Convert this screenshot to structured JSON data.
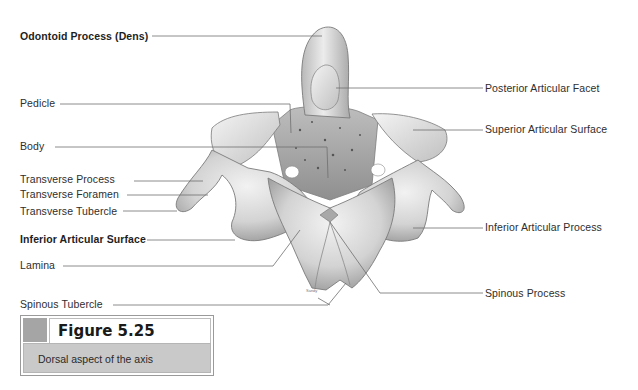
{
  "figure": {
    "number_label": "Figure 5.25",
    "caption": "Dorsal aspect of the axis",
    "swatch_color": "#a5a5a5",
    "caption_bg": "#c9c9c9"
  },
  "illustration": {
    "subject": "Axis (C2 vertebra), dorsal view",
    "artist_signature": "Sandy"
  },
  "labels_left": [
    {
      "text": "Odontoid Process (Dens)",
      "bold": true
    },
    {
      "text": "Pedicle",
      "bold": false
    },
    {
      "text": "Body",
      "bold": false
    },
    {
      "text": "Transverse Process",
      "bold": false
    },
    {
      "text": "Transverse Foramen",
      "bold": false
    },
    {
      "text": "Transverse Tubercle",
      "bold": false
    },
    {
      "text": "Inferior Articular Surface",
      "bold": true
    },
    {
      "text": "Lamina",
      "bold": false
    },
    {
      "text": "Spinous Tubercle",
      "bold": false
    }
  ],
  "labels_right": [
    {
      "text": "Posterior Articular Facet",
      "bold": false
    },
    {
      "text": "Superior Articular Surface",
      "bold": false
    },
    {
      "text": "Inferior Articular Process",
      "bold": false
    },
    {
      "text": "Spinous Process",
      "bold": false
    }
  ],
  "colors": {
    "leader_line": "#6f6f6f",
    "bone_light": "#ececec",
    "bone_mid": "#c4c4c4",
    "bone_dark": "#8d8d8d"
  }
}
